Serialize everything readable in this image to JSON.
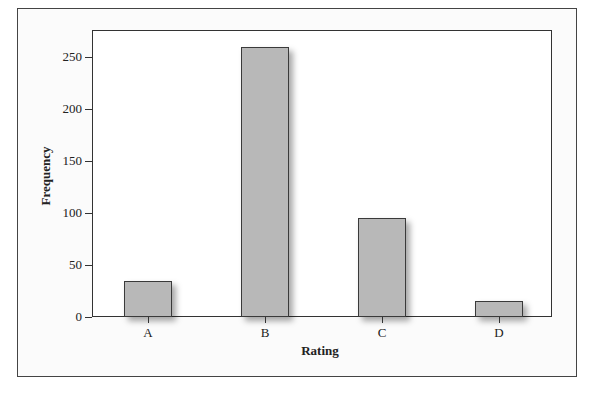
{
  "chart_data": {
    "type": "bar",
    "title": "",
    "xlabel": "Rating",
    "ylabel": "Frequency",
    "categories": [
      "A",
      "B",
      "C",
      "D"
    ],
    "values": [
      35,
      260,
      95,
      15
    ],
    "ylim": [
      0,
      275
    ],
    "yticks": [
      0,
      50,
      100,
      150,
      200,
      250
    ],
    "ytick_labels": [
      "0",
      "50",
      "100",
      "150",
      "200",
      "250"
    ],
    "grid": false,
    "legend": null,
    "bar_color": "#b8b8b8"
  }
}
